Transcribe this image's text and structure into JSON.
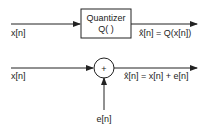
{
  "top_system": {
    "input_label": "x[n]",
    "block_title": "Quantizer",
    "block_function": "Q( )",
    "output_label": "x̂[n] = Q(x[n])"
  },
  "bottom_system": {
    "input_label": "x[n]",
    "adder_symbol": "+",
    "noise_label": "e[n]",
    "output_label": "x̂[n] = x[n] + e[n]"
  },
  "colors": {
    "line": "#222222",
    "background": "#ffffff"
  }
}
